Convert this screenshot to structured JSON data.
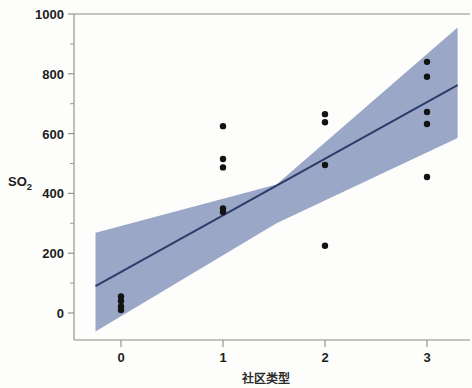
{
  "chart_data": {
    "type": "scatter",
    "title": "",
    "xlabel": "社区类型",
    "ylabel": "SO2",
    "ylabel_base": "SO",
    "ylabel_sub": "2",
    "xlim": [
      -0.35,
      3.45
    ],
    "ylim": [
      -100,
      1000
    ],
    "xticks": [
      0,
      1,
      2,
      3
    ],
    "xtick_labels": [
      "0",
      "1",
      "2",
      "3"
    ],
    "yticks": [
      0,
      200,
      400,
      600,
      800,
      1000
    ],
    "ytick_labels": [
      "0",
      "200",
      "400",
      "600",
      "800",
      "1000"
    ],
    "yticks_minor": [
      100,
      300,
      500,
      700,
      900
    ],
    "grid": false,
    "legend": null,
    "points": [
      {
        "x": 0,
        "y": 55
      },
      {
        "x": 0,
        "y": 40
      },
      {
        "x": 0,
        "y": 22
      },
      {
        "x": 0,
        "y": 10
      },
      {
        "x": 1,
        "y": 625
      },
      {
        "x": 1,
        "y": 515
      },
      {
        "x": 1,
        "y": 487
      },
      {
        "x": 1,
        "y": 350
      },
      {
        "x": 1,
        "y": 338
      },
      {
        "x": 2,
        "y": 665
      },
      {
        "x": 2,
        "y": 638
      },
      {
        "x": 2,
        "y": 495
      },
      {
        "x": 2,
        "y": 225
      },
      {
        "x": 3,
        "y": 840
      },
      {
        "x": 3,
        "y": 790
      },
      {
        "x": 3,
        "y": 672
      },
      {
        "x": 3,
        "y": 632
      },
      {
        "x": 3,
        "y": 455
      }
    ],
    "fit_line": {
      "type": "linear-regression",
      "x_start": -0.25,
      "y_start": 90,
      "x_end": 3.3,
      "y_end": 762,
      "slope": 189.3,
      "intercept": 137.3,
      "color": "#2d3a6b"
    },
    "confidence_band": {
      "label": "confidence interval",
      "color": "#9aa7c6",
      "x_start": -0.25,
      "x_end": 3.3,
      "upper_start": 268,
      "lower_start": -62,
      "upper_mid": 430,
      "lower_mid": 300,
      "upper_end": 955,
      "lower_end": 585
    }
  },
  "figure": {
    "background_color": "#fdfdfc",
    "frame_color": "#8b8b86",
    "point_color": "#131313"
  }
}
